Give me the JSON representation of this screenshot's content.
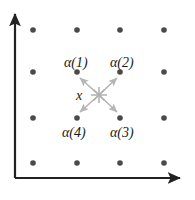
{
  "figure": {
    "background_color": "#ffffff",
    "width": 195,
    "height": 200
  },
  "axes": {
    "color": "#222222",
    "y_axis": {
      "name": "vertical-axis",
      "x": 15,
      "y_top": 12,
      "y_bottom": 178,
      "arrow": "up"
    },
    "x_axis": {
      "name": "horizontal-axis",
      "y": 178,
      "x_left": 15,
      "x_right": 182,
      "arrow": "right"
    }
  },
  "lattice": {
    "dot_color": "#4a4a4a",
    "dot_radius": 2.8,
    "columns_x": [
      33,
      77,
      120,
      164
    ],
    "rows_y": [
      30,
      72,
      118,
      163
    ],
    "points": [
      {
        "x": 33,
        "y": 30
      },
      {
        "x": 77,
        "y": 30
      },
      {
        "x": 120,
        "y": 30
      },
      {
        "x": 164,
        "y": 30
      },
      {
        "x": 33,
        "y": 72
      },
      {
        "x": 77,
        "y": 72
      },
      {
        "x": 120,
        "y": 72
      },
      {
        "x": 164,
        "y": 72
      },
      {
        "x": 33,
        "y": 118
      },
      {
        "x": 77,
        "y": 118
      },
      {
        "x": 120,
        "y": 118
      },
      {
        "x": 164,
        "y": 118
      },
      {
        "x": 33,
        "y": 163
      },
      {
        "x": 77,
        "y": 163
      },
      {
        "x": 120,
        "y": 163
      },
      {
        "x": 164,
        "y": 163
      }
    ]
  },
  "center": {
    "label": "x",
    "marker": "star",
    "marker_color": "#b0b0b0",
    "x": 99,
    "y": 95,
    "label_x": 76,
    "label_y": 89
  },
  "vectors": {
    "color": "#b5b5b5",
    "items": [
      {
        "id": "alpha1",
        "label": "α(1)",
        "target_x": 77,
        "target_y": 72,
        "label_x": 64,
        "label_y": 56
      },
      {
        "id": "alpha2",
        "label": "α(2)",
        "target_x": 120,
        "target_y": 72,
        "label_x": 110,
        "label_y": 56
      },
      {
        "id": "alpha3",
        "label": "α(3)",
        "target_x": 120,
        "target_y": 118,
        "label_x": 110,
        "label_y": 126
      },
      {
        "id": "alpha4",
        "label": "α(4)",
        "target_x": 77,
        "target_y": 118,
        "label_x": 62,
        "label_y": 126
      }
    ]
  }
}
